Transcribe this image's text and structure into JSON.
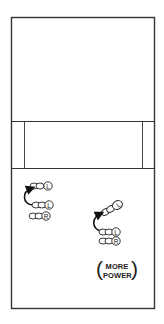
{
  "diagram": {
    "title": "",
    "court": {
      "line_color": "#333333",
      "outer": {
        "x": 11,
        "y": 17,
        "width": 143,
        "height": 291
      },
      "band": {
        "top": 121,
        "bottom": 168,
        "inner_left_x": 24,
        "inner_right_x": 142
      }
    },
    "left_sequence": {
      "steps": [
        {
          "foot_label": "L",
          "position": "upper",
          "note": "destination step"
        },
        {
          "foot_label": "L",
          "position": "middle",
          "note": "starting step"
        },
        {
          "foot_label": "R",
          "position": "lower",
          "note": "stationary foot"
        }
      ],
      "arrow": "curved arrow from middle L step up to upper L step"
    },
    "right_sequence": {
      "steps": [
        {
          "foot_label": "L",
          "position": "upper-diagonal",
          "note": "destination step, angled"
        },
        {
          "foot_label": "L",
          "position": "middle",
          "note": "starting step"
        },
        {
          "foot_label": "R",
          "position": "lower",
          "note": "stationary foot"
        }
      ],
      "arrow": "curved arrow from middle L step up to angled upper L step"
    },
    "label": {
      "open_paren": "(",
      "line1": "MORE",
      "line2": "POWER",
      "close_paren": ")"
    },
    "foot_labels": {
      "left": "L",
      "right": "R"
    }
  }
}
